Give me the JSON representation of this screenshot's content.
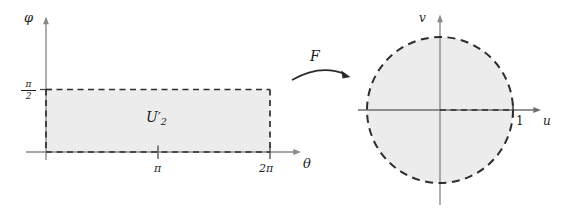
{
  "figure": {
    "title": "",
    "background_color": "#ffffff",
    "fill_color": "#ececec",
    "dash_color": "#2e2e2e",
    "axis_color": "#8a8a8a",
    "text_color": "#1c1c1c"
  },
  "left_panel": {
    "type": "rectangle-domain",
    "vertical_axis_label": "φ",
    "horizontal_axis_label": "θ",
    "region_label_base": "U",
    "region_label_prime": "′",
    "region_label_subscript": "2",
    "y_ticks": [
      {
        "label_numerator": "π",
        "label_denominator": "2",
        "value": "π/2"
      }
    ],
    "x_ticks": [
      {
        "label": "π",
        "value": "π"
      },
      {
        "label": "2π",
        "value": "2π"
      }
    ],
    "region_bounds": {
      "x_min": "0",
      "x_max": "2π",
      "y_min": "0",
      "y_max": "π/2"
    }
  },
  "map_arrow": {
    "label": "F",
    "direction": "left-to-right",
    "style": "curved-arrow"
  },
  "right_panel": {
    "type": "disk-image",
    "vertical_axis_label": "v",
    "horizontal_axis_label": "u",
    "radius_label": "1",
    "region_shape": "filled-circle",
    "boundary_style": "dashed",
    "center": {
      "u": "0",
      "v": "0"
    },
    "radius_value": "1"
  }
}
